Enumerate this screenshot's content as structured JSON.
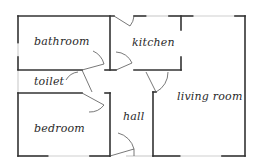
{
  "diagram": {
    "type": "floor-plan",
    "rooms": [
      {
        "id": "bathroom",
        "label": "bathroom"
      },
      {
        "id": "kitchen",
        "label": "kitchen"
      },
      {
        "id": "toilet",
        "label": "toilet"
      },
      {
        "id": "living-room",
        "label": "living room"
      },
      {
        "id": "bedroom",
        "label": "bedroom"
      },
      {
        "id": "hall",
        "label": "hall"
      }
    ],
    "colors": {
      "wall": "#333333",
      "window": "#cfcfcf",
      "door": "#555555",
      "background": "#ffffff"
    }
  }
}
